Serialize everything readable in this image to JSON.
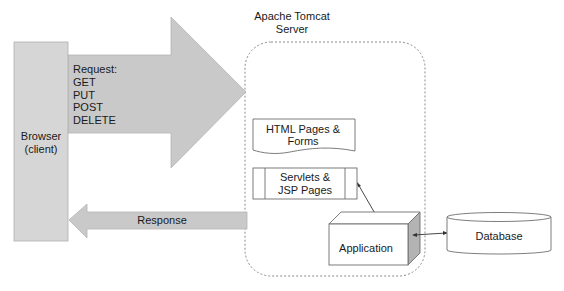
{
  "title": {
    "line1": "Apache Tomcat",
    "line2": "Server"
  },
  "browser": {
    "line1": "Browser",
    "line2": "(client)"
  },
  "request": {
    "heading": "Request:",
    "methods": [
      "GET",
      "PUT",
      "POST",
      "DELETE"
    ]
  },
  "response": {
    "label": "Response"
  },
  "components": {
    "html_pages": {
      "line1": "HTML Pages &",
      "line2": "Forms"
    },
    "servlets": {
      "line1": "Servlets &",
      "line2": "JSP Pages"
    },
    "application": {
      "label": "Application"
    },
    "database": {
      "label": "Database"
    }
  },
  "colors": {
    "arrow_fill": "#c8c8c8",
    "browser_fill": "#d4d4d4",
    "stroke": "#7a7a7a",
    "cube_side": "#b0b0b0"
  }
}
